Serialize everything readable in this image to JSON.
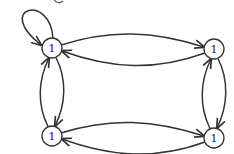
{
  "diagram": {
    "type": "directed-graph",
    "nodes": [
      {
        "id": "tl",
        "label": "1"
      },
      {
        "id": "tr",
        "label": "1"
      },
      {
        "id": "bl",
        "label": "1"
      },
      {
        "id": "br",
        "label": "1"
      }
    ],
    "edges": [
      {
        "from": "tl",
        "to": "tl",
        "kind": "self-loop"
      },
      {
        "from": "tl",
        "to": "tr"
      },
      {
        "from": "tr",
        "to": "tl"
      },
      {
        "from": "bl",
        "to": "br"
      },
      {
        "from": "br",
        "to": "bl"
      },
      {
        "from": "tl",
        "to": "bl"
      },
      {
        "from": "bl",
        "to": "tl"
      },
      {
        "from": "tr",
        "to": "br"
      },
      {
        "from": "br",
        "to": "tr"
      }
    ],
    "colors": {
      "stroke": "#333333",
      "background": "#ffffff"
    }
  }
}
